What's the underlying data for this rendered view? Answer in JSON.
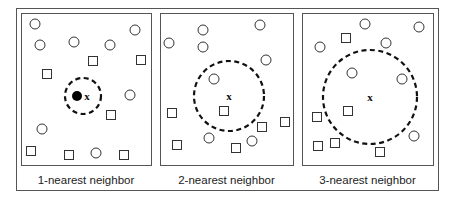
{
  "figure": {
    "colors": {
      "stroke": "#333333",
      "frame": "#555555",
      "background": "#ffffff",
      "text": "#222222"
    },
    "query_label": "x",
    "panels": [
      {
        "caption": "1-nearest neighbor",
        "k": 1,
        "box": {
          "x": 21,
          "y": 13,
          "w": 130,
          "h": 152
        },
        "query": {
          "x": 87,
          "y": 96
        },
        "neighborhood_radius": 18,
        "highlighted_point": {
          "x": 77,
          "y": 96
        },
        "circles": [
          [
            35,
            24
          ],
          [
            135,
            30
          ],
          [
            40,
            45
          ],
          [
            74,
            42
          ],
          [
            110,
            45
          ],
          [
            130,
            95
          ],
          [
            42,
            129
          ],
          [
            96,
            153
          ]
        ],
        "squares": [
          [
            93,
            61
          ],
          [
            141,
            60
          ],
          [
            47,
            74
          ],
          [
            111,
            115
          ],
          [
            31,
            151
          ],
          [
            69,
            155
          ],
          [
            124,
            155
          ]
        ]
      },
      {
        "caption": "2-nearest neighbor",
        "k": 2,
        "box": {
          "x": 160,
          "y": 13,
          "w": 133,
          "h": 152
        },
        "query": {
          "x": 229,
          "y": 96
        },
        "neighborhood_radius": 35,
        "circles": [
          [
            203,
            30
          ],
          [
            260,
            25
          ],
          [
            169,
            43
          ],
          [
            203,
            47
          ],
          [
            266,
            60
          ],
          [
            214,
            79
          ],
          [
            209,
            138
          ],
          [
            252,
            141
          ]
        ],
        "squares": [
          [
            172,
            113
          ],
          [
            224,
            111
          ],
          [
            262,
            127
          ],
          [
            285,
            122
          ],
          [
            177,
            145
          ],
          [
            236,
            148
          ]
        ]
      },
      {
        "caption": "3-nearest neighbor",
        "k": 3,
        "box": {
          "x": 302,
          "y": 13,
          "w": 131,
          "h": 152
        },
        "query": {
          "x": 370,
          "y": 97
        },
        "neighborhood_radius": 47,
        "circles": [
          [
            365,
            24
          ],
          [
            419,
            27
          ],
          [
            320,
            47
          ],
          [
            386,
            43
          ],
          [
            352,
            73
          ],
          [
            402,
            79
          ],
          [
            414,
            136
          ]
        ],
        "squares": [
          [
            346,
            38
          ],
          [
            348,
            111
          ],
          [
            317,
            117
          ],
          [
            335,
            143
          ],
          [
            318,
            146
          ],
          [
            380,
            152
          ]
        ]
      }
    ]
  }
}
